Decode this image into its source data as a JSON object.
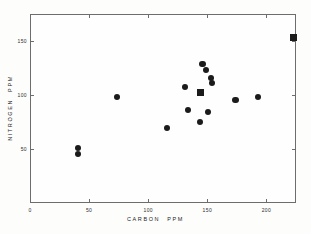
{
  "chart_data": {
    "type": "scatter",
    "title": "",
    "xlabel": "CARBON   PPM",
    "ylabel": "NITROGEN   PPM",
    "xlim": [
      0,
      225
    ],
    "ylim": [
      0,
      175
    ],
    "xticks": [
      0,
      50,
      100,
      150,
      200
    ],
    "xtick_labels": [
      "0",
      "50",
      "100",
      "150",
      "200"
    ],
    "yticks": [
      50,
      100,
      150
    ],
    "ytick_labels": [
      "50",
      "100",
      "150"
    ],
    "grid": false,
    "legend": null,
    "series": [
      {
        "name": "circle-samples",
        "marker": "circle",
        "color": "#1b1b1b",
        "points": [
          {
            "x": 40,
            "y": 52
          },
          {
            "x": 40,
            "y": 46
          },
          {
            "x": 73,
            "y": 99
          },
          {
            "x": 115,
            "y": 70
          },
          {
            "x": 130,
            "y": 108
          },
          {
            "x": 133,
            "y": 87
          },
          {
            "x": 143,
            "y": 76
          },
          {
            "x": 145,
            "y": 130
          },
          {
            "x": 148,
            "y": 124
          },
          {
            "x": 150,
            "y": 85
          },
          {
            "x": 152,
            "y": 117
          },
          {
            "x": 153,
            "y": 112
          },
          {
            "x": 173,
            "y": 96
          },
          {
            "x": 192,
            "y": 99
          }
        ]
      },
      {
        "name": "square-samples",
        "marker": "square",
        "color": "#1b1b1b",
        "points": [
          {
            "x": 143,
            "y": 103
          },
          {
            "x": 222,
            "y": 154
          }
        ]
      }
    ]
  },
  "axes": {
    "x_label": "CARBON   PPM",
    "y_label": "NITROGEN   PPM"
  }
}
